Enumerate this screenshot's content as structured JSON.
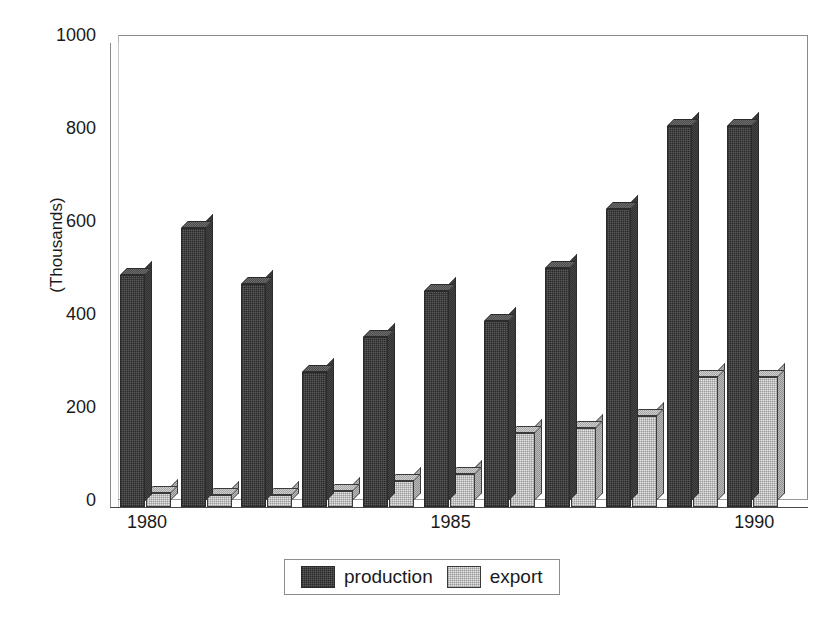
{
  "chart_data": {
    "type": "bar",
    "title": "",
    "subtitle": "",
    "xlabel": "",
    "ylabel": "(Thousands)",
    "ylim": [
      0,
      1000
    ],
    "yticks": [
      0,
      200,
      400,
      600,
      800,
      1000
    ],
    "ytick_labels": [
      "0",
      "200",
      "400",
      "600",
      "800",
      "1000"
    ],
    "grid": false,
    "legend_position": "bottom",
    "style": "3d-column",
    "categories": [
      "1980",
      "1981",
      "1982",
      "1983",
      "1984",
      "1985",
      "1986",
      "1987",
      "1988",
      "1989",
      "1990"
    ],
    "xtick_labels": [
      "1980",
      "1985",
      "1990"
    ],
    "xtick_categories": [
      "1980",
      "1985",
      "1990"
    ],
    "series": [
      {
        "name": "production",
        "color": "#5a5a5a",
        "values": [
          500,
          600,
          480,
          290,
          365,
          465,
          400,
          515,
          640,
          820,
          820
        ]
      },
      {
        "name": "export",
        "color": "#e3e3e3",
        "values": [
          30,
          25,
          25,
          35,
          55,
          70,
          160,
          170,
          195,
          280,
          280
        ]
      }
    ]
  },
  "legend": {
    "items": [
      {
        "label": "production",
        "swatch": "production-swatch"
      },
      {
        "label": "export",
        "swatch": "export-swatch"
      }
    ]
  },
  "axis": {
    "y_title": "(Thousands)"
  }
}
